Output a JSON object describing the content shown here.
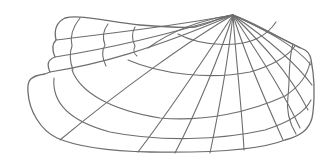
{
  "figure": {
    "stroke_color": "#6e6e6e",
    "background_color": "#ffffff",
    "parts": {
      "outline": "shell-outline",
      "growth_lines": 4,
      "radial_ribs": 12,
      "posterior_wing_lines": 3
    }
  }
}
